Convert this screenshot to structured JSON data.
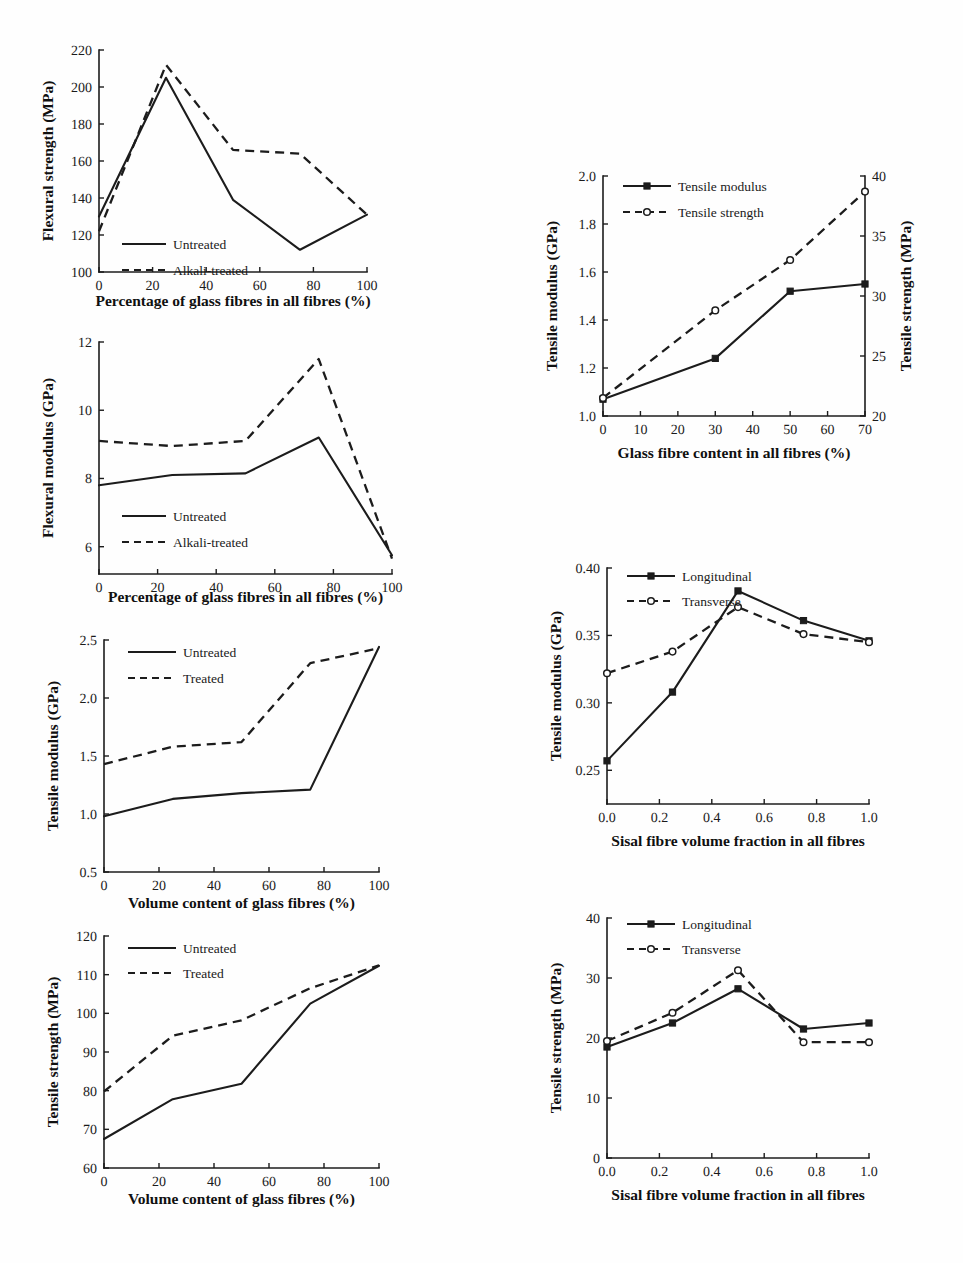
{
  "figure": {
    "background_color": "#fefefe",
    "ink_color": "#1c1c1c",
    "panel_count": 6
  },
  "chart_data": [
    {
      "id": "flexural-strength-glass-percentage",
      "type": "line",
      "title": "",
      "xlabel": "Percentage of glass fibres in all fibres (%)",
      "ylabel": "Flexural strength (MPa)",
      "xlim": [
        0,
        100
      ],
      "ylim": [
        100,
        220
      ],
      "xticks": [
        0,
        20,
        40,
        60,
        80,
        100
      ],
      "xtick_labels": [
        "0",
        "20",
        "40",
        "60",
        "80",
        "100"
      ],
      "yticks": [
        100,
        120,
        140,
        160,
        180,
        200,
        220
      ],
      "ytick_labels": [
        "100",
        "120",
        "140",
        "160",
        "180",
        "200",
        "220"
      ],
      "grid": false,
      "legend_position": "lower-left",
      "x": [
        0,
        25,
        50,
        75,
        100
      ],
      "series": [
        {
          "name": "Untreated",
          "style": "solid",
          "marker": "none",
          "values": [
            130,
            205,
            139,
            112,
            131
          ]
        },
        {
          "name": "Alkali-treated",
          "style": "dashed",
          "marker": "none",
          "values": [
            122,
            212,
            166,
            164,
            131
          ]
        }
      ]
    },
    {
      "id": "flexural-modulus-glass-percentage",
      "type": "line",
      "title": "",
      "xlabel": "Percentage of glass fibres in all fibres (%)",
      "ylabel": "Flexural modulus (GPa)",
      "xlim": [
        0,
        100
      ],
      "ylim": [
        5.2,
        12
      ],
      "xticks": [
        0,
        20,
        40,
        60,
        80,
        100
      ],
      "xtick_labels": [
        "0",
        "20",
        "40",
        "60",
        "80",
        "100"
      ],
      "yticks": [
        6,
        8,
        10,
        12
      ],
      "ytick_labels": [
        "6",
        "8",
        "10",
        "12"
      ],
      "grid": false,
      "legend_position": "lower-left",
      "x": [
        0,
        25,
        50,
        75,
        100
      ],
      "series": [
        {
          "name": "Untreated",
          "style": "solid",
          "marker": "none",
          "values": [
            7.8,
            8.1,
            8.15,
            9.2,
            5.75
          ]
        },
        {
          "name": "Alkali-treated",
          "style": "dashed",
          "marker": "none",
          "values": [
            9.1,
            8.95,
            9.1,
            11.5,
            5.65
          ]
        }
      ]
    },
    {
      "id": "tensile-modulus-glass-volume",
      "type": "line",
      "title": "",
      "xlabel": "Volume content of glass fibres (%)",
      "ylabel": "Tensile modulus (GPa)",
      "xlim": [
        0,
        100
      ],
      "ylim": [
        0.5,
        2.5
      ],
      "xticks": [
        0,
        20,
        40,
        60,
        80,
        100
      ],
      "xtick_labels": [
        "0",
        "20",
        "40",
        "60",
        "80",
        "100"
      ],
      "yticks": [
        0.5,
        1.0,
        1.5,
        2.0,
        2.5
      ],
      "ytick_labels": [
        "0.5",
        "1.0",
        "1.5",
        "2.0",
        "2.5"
      ],
      "grid": false,
      "legend_position": "upper-left",
      "x": [
        0,
        25,
        50,
        75,
        100
      ],
      "series": [
        {
          "name": "Untreated",
          "style": "solid",
          "marker": "none",
          "values": [
            0.98,
            1.13,
            1.18,
            1.21,
            2.44
          ]
        },
        {
          "name": "Treated",
          "style": "dashed",
          "marker": "none",
          "values": [
            1.43,
            1.58,
            1.62,
            2.3,
            2.43
          ]
        }
      ]
    },
    {
      "id": "tensile-strength-glass-volume",
      "type": "line",
      "title": "",
      "xlabel": "Volume content of glass fibres (%)",
      "ylabel": "Tensile strength (MPa)",
      "xlim": [
        0,
        100
      ],
      "ylim": [
        60,
        120
      ],
      "xticks": [
        0,
        20,
        40,
        60,
        80,
        100
      ],
      "xtick_labels": [
        "0",
        "20",
        "40",
        "60",
        "80",
        "100"
      ],
      "yticks": [
        60,
        70,
        80,
        90,
        100,
        110,
        120
      ],
      "ytick_labels": [
        "60",
        "70",
        "80",
        "90",
        "100",
        "110",
        "120"
      ],
      "grid": false,
      "legend_position": "upper-left",
      "x": [
        0,
        25,
        50,
        75,
        100
      ],
      "series": [
        {
          "name": "Untreated",
          "style": "solid",
          "marker": "none",
          "values": [
            67.5,
            77.8,
            81.8,
            102.5,
            112.3
          ]
        },
        {
          "name": "Treated",
          "style": "dashed",
          "marker": "none",
          "values": [
            79.8,
            94.2,
            98.2,
            106.5,
            112.4
          ]
        }
      ]
    },
    {
      "id": "tensile-modulus-strength-glass-content",
      "type": "line",
      "title": "",
      "xlabel": "Glass fibre content in all fibres (%)",
      "ylabel": "Tensile modulus (GPa)",
      "y2label": "Tensile strength (MPa)",
      "xlim": [
        0,
        70
      ],
      "ylim": [
        1.0,
        2.0
      ],
      "y2lim": [
        20,
        40
      ],
      "xticks": [
        0,
        10,
        20,
        30,
        40,
        50,
        60,
        70
      ],
      "xtick_labels": [
        "0",
        "10",
        "20",
        "30",
        "40",
        "50",
        "60",
        "70"
      ],
      "yticks": [
        1.0,
        1.2,
        1.4,
        1.6,
        1.8,
        2.0
      ],
      "ytick_labels": [
        "1.0",
        "1.2",
        "1.4",
        "1.6",
        "1.8",
        "2.0"
      ],
      "y2ticks": [
        20,
        25,
        30,
        35,
        40
      ],
      "y2tick_labels": [
        "20",
        "25",
        "30",
        "35",
        "40"
      ],
      "grid": false,
      "legend_position": "upper-left",
      "x": [
        0,
        30,
        50,
        70
      ],
      "series": [
        {
          "name": "Tensile modulus",
          "style": "solid",
          "marker": "filled-square",
          "axis": "left",
          "values": [
            1.07,
            1.24,
            1.52,
            1.55
          ]
        },
        {
          "name": "Tensile strength",
          "style": "dashed",
          "marker": "open-circle",
          "axis": "right",
          "values": [
            21.5,
            28.8,
            33.0,
            38.7
          ]
        }
      ]
    },
    {
      "id": "tensile-modulus-sisal-fraction",
      "type": "line",
      "title": "",
      "xlabel": "Sisal fibre volume fraction in all fibres",
      "ylabel": "Tensile modulus (GPa)",
      "xlim": [
        0.0,
        1.0
      ],
      "ylim": [
        0.225,
        0.4
      ],
      "xticks": [
        0.0,
        0.2,
        0.4,
        0.6,
        0.8,
        1.0
      ],
      "xtick_labels": [
        "0.0",
        "0.2",
        "0.4",
        "0.6",
        "0.8",
        "1.0"
      ],
      "yticks": [
        0.25,
        0.3,
        0.35,
        0.4
      ],
      "ytick_labels": [
        "0.25",
        "0.30",
        "0.35",
        "0.40"
      ],
      "grid": false,
      "legend_position": "upper-left",
      "x": [
        0.0,
        0.25,
        0.5,
        0.75,
        1.0
      ],
      "series": [
        {
          "name": "Longitudinal",
          "style": "solid",
          "marker": "filled-square",
          "values": [
            0.257,
            0.308,
            0.383,
            0.361,
            0.346
          ]
        },
        {
          "name": "Transverse",
          "style": "dashed",
          "marker": "open-circle",
          "values": [
            0.322,
            0.338,
            0.371,
            0.351,
            0.345
          ]
        }
      ]
    },
    {
      "id": "tensile-strength-sisal-fraction",
      "type": "line",
      "title": "",
      "xlabel": "Sisal fibre volume fraction in all fibres",
      "ylabel": "Tensile strength (MPa)",
      "xlim": [
        0.0,
        1.0
      ],
      "ylim": [
        0,
        40
      ],
      "xticks": [
        0.0,
        0.2,
        0.4,
        0.6,
        0.8,
        1.0
      ],
      "xtick_labels": [
        "0.0",
        "0.2",
        "0.4",
        "0.6",
        "0.8",
        "1.0"
      ],
      "yticks": [
        0,
        10,
        20,
        30,
        40
      ],
      "ytick_labels": [
        "0",
        "10",
        "20",
        "30",
        "40"
      ],
      "grid": false,
      "legend_position": "upper-left",
      "x": [
        0.0,
        0.25,
        0.5,
        0.75,
        1.0
      ],
      "series": [
        {
          "name": "Longitudinal",
          "style": "solid",
          "marker": "filled-square",
          "values": [
            18.5,
            22.5,
            28.2,
            21.5,
            22.5
          ]
        },
        {
          "name": "Transverse",
          "style": "dashed",
          "marker": "open-circle",
          "values": [
            19.5,
            24.2,
            31.3,
            19.3,
            19.3
          ]
        }
      ]
    }
  ]
}
